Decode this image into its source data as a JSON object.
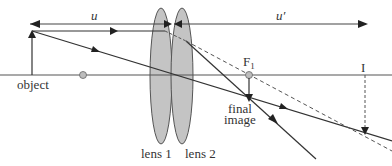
{
  "diagram": {
    "labels": {
      "u": "u",
      "u_prime": "u′",
      "object": "object",
      "focal_point": "F",
      "focal_point_sub": "1",
      "intermediate_image": "I",
      "final_image_line1": "final",
      "final_image_line2": "image",
      "lens1": "lens 1",
      "lens2": "lens 2"
    },
    "colors": {
      "line": "#333333",
      "axis": "#555555",
      "lens_fill": "#c4c4c4",
      "lens_stroke": "#555555",
      "dot_fill": "#bdbdbd",
      "dashed": "#555555"
    },
    "elements": {
      "optical_axis": {
        "y": 75
      },
      "object_arrow": {
        "x": 32,
        "y_base": 75,
        "y_tip": 31
      },
      "lens1": {
        "cx": 161,
        "cy": 76,
        "rx": 11,
        "ry": 68
      },
      "lens2": {
        "cx": 182,
        "cy": 76,
        "rx": 11,
        "ry": 68
      },
      "focal_point_left": {
        "x": 83,
        "y": 75
      },
      "focal_point_F1": {
        "x": 249,
        "y": 75
      },
      "final_image": {
        "x": 249,
        "y": 102
      },
      "intermediate_image_I": {
        "x": 365,
        "y_top": 75,
        "y_tip": 134
      }
    }
  }
}
